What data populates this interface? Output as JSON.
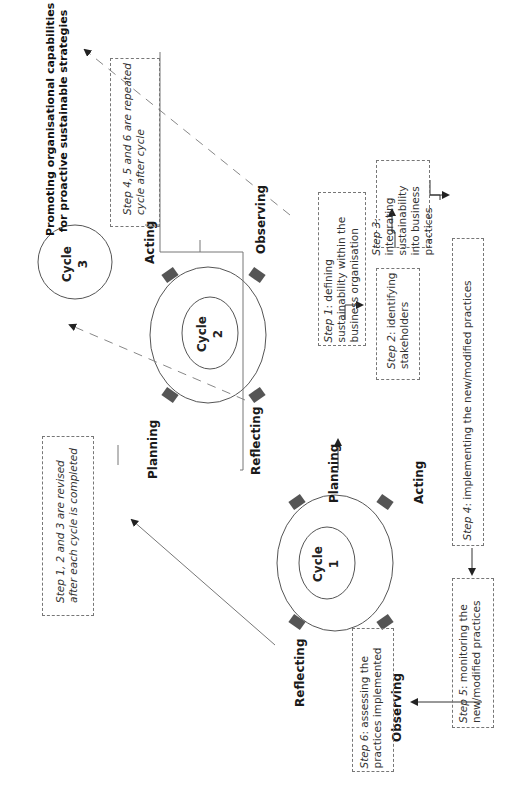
{
  "title": "Promoting organisational capabilities for proactive sustainable strategies",
  "title_lines": [
    "Promoting organisational capabilities",
    "for proactive sustainable strategies"
  ],
  "cycles": [
    {
      "label": "Cycle",
      "number": "1"
    },
    {
      "label": "Cycle",
      "number": "2"
    },
    {
      "label": "Cycle",
      "number": "3"
    }
  ],
  "phase_labels": {
    "cycle1": {
      "planning": "Planning",
      "acting": "Acting",
      "observing": "Observing",
      "reflecting": "Reflecting"
    },
    "cycle2": {
      "planning": "Planning",
      "acting": "Acting",
      "observing": "Observing",
      "reflecting": "Reflecting"
    }
  },
  "steps": {
    "step1": {
      "prefix": "Step 1",
      "text": ": defining sustainability within the business organisation"
    },
    "step2": {
      "prefix": "Step 2",
      "text": ": identifying stakeholders"
    },
    "step3": {
      "prefix": "Step 3",
      "text": ": integrating sustainability into business practices"
    },
    "step4": {
      "prefix": "Step 4",
      "text": ": implementing the new/modified practices"
    },
    "step5": {
      "prefix": "Step 5",
      "text": ": monitoring the new/modified practices"
    },
    "step6": {
      "prefix": "Step 6",
      "text": ": assessing the practices implemented"
    }
  },
  "notes": {
    "revised": "Step 1, 2 and 3 are revised after each cycle is completed",
    "repeated": "Step 4, 5 and 6 are repeated cycle after cycle"
  },
  "colors": {
    "arrow_fill": "#555555",
    "line": "#777777",
    "dashed": "#888888"
  }
}
